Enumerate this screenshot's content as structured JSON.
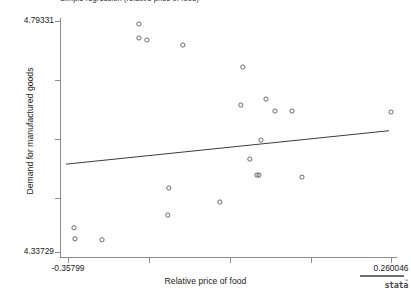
{
  "title": "Simple regression (relative price of food)",
  "axes": {
    "x_title": "Relative price of food",
    "y_title": "Demand for manufactured goods",
    "x_tick_low": "-0.35799",
    "x_tick_high": "0.260046",
    "y_tick_low": "4.33729",
    "y_tick_high": "4.79331"
  },
  "logo": {
    "word": "stata",
    "tm": "™"
  },
  "colors": {
    "marker_stroke": "#5a5a5a",
    "line": "#3c3c3c",
    "axis": "#8c8c8c",
    "text": "#1a1a1a",
    "background": "#ffffff"
  },
  "chart_data": {
    "type": "scatter",
    "title": "Simple regression (relative price of food)",
    "xlabel": "Relative price of food",
    "ylabel": "Demand for manufactured goods",
    "xlim": [
      -0.35799,
      0.260046
    ],
    "ylim": [
      4.33729,
      4.79331
    ],
    "grid": false,
    "legend": null,
    "x_ticks": [
      -0.35799,
      0.260046
    ],
    "y_ticks": [
      4.79331,
      4.33729
    ],
    "marker": "open-circle",
    "series": [
      {
        "name": "Observations",
        "points": [
          {
            "x": -0.2224,
            "y": 4.7874
          },
          {
            "x": -0.2224,
            "y": 4.7598
          },
          {
            "x": -0.2071,
            "y": 4.7558
          },
          {
            "x": -0.1383,
            "y": 4.7459
          },
          {
            "x": -0.0235,
            "y": 4.7024
          },
          {
            "x": 0.0208,
            "y": 4.6392
          },
          {
            "x": -0.0273,
            "y": 4.6274
          },
          {
            "x": 0.038,
            "y": 4.6155
          },
          {
            "x": 0.0706,
            "y": 4.6155
          },
          {
            "x": 0.2601,
            "y": 4.6135
          },
          {
            "x": 0.0112,
            "y": 4.5582
          },
          {
            "x": -0.0101,
            "y": 4.5207
          },
          {
            "x": 0.0035,
            "y": 4.4892
          },
          {
            "x": 0.0074,
            "y": 4.4892
          },
          {
            "x": 0.0897,
            "y": 4.4852
          },
          {
            "x": -0.1651,
            "y": 4.4635
          },
          {
            "x": -0.0675,
            "y": 4.4359
          },
          {
            "x": -0.167,
            "y": 4.4102
          },
          {
            "x": -0.3465,
            "y": 4.3852
          },
          {
            "x": -0.3446,
            "y": 4.3634
          },
          {
            "x": -0.2929,
            "y": 4.3614
          }
        ]
      }
    ],
    "fit_line": {
      "name": "Linear fit",
      "x0": -0.3618,
      "y0": 4.5107,
      "x1": 0.2562,
      "y1": 4.5767
    }
  }
}
